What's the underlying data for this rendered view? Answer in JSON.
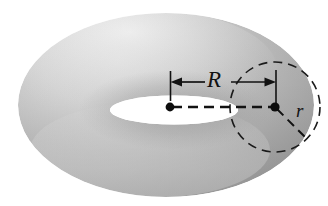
{
  "figure": {
    "kind": "torus-diagram",
    "background_color": "#ffffff"
  },
  "labels": {
    "major_radius": "R",
    "minor_radius": "r"
  },
  "colors": {
    "stroke": "#121212",
    "torus_light": "#e4e4e4",
    "torus_mid": "#b9b9b9",
    "torus_dark": "#9a9a9a",
    "torus_shadow": "#8c8c8c",
    "hole_fill": "#ffffff"
  },
  "geometry": {
    "outer_ellipse": {
      "cx": 166,
      "cy": 105,
      "rx": 148,
      "ry": 92
    },
    "hole_ellipse": {
      "cx": 174,
      "cy": 110,
      "rx": 64,
      "ry": 14
    },
    "tube_circle": {
      "cx": 275,
      "cy": 107,
      "r": 45
    },
    "center_dot_left": {
      "cx": 170,
      "cy": 107,
      "r": 4
    },
    "center_dot_right": {
      "cx": 275,
      "cy": 107,
      "r": 4
    },
    "tick_left": {
      "x": 170,
      "y1": 72,
      "y2": 101
    },
    "tick_right": {
      "x": 276,
      "y1": 71,
      "y2": 103
    },
    "arrow_row_y": 82,
    "minor_radius_line": {
      "x1": 275,
      "y1": 107,
      "x2": 307,
      "y2": 139
    }
  }
}
